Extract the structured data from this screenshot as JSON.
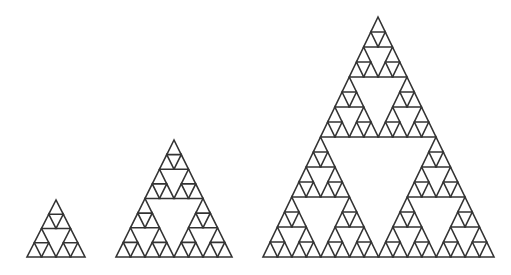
{
  "diagram": {
    "type": "sierpinski-triangles",
    "background": "#ffffff",
    "stroke": "#333333",
    "stroke_width": 1.6,
    "figures": [
      {
        "name": "sierpinski-depth-2",
        "depth": 2,
        "apex": [
          56,
          200
        ],
        "base_left": [
          27,
          257
        ],
        "base_right": [
          85,
          257
        ]
      },
      {
        "name": "sierpinski-depth-3",
        "depth": 3,
        "apex": [
          174,
          140
        ],
        "base_left": [
          116,
          257
        ],
        "base_right": [
          232,
          257
        ]
      },
      {
        "name": "sierpinski-depth-4",
        "depth": 4,
        "apex": [
          378,
          17
        ],
        "base_left": [
          263,
          257
        ],
        "base_right": [
          494,
          257
        ]
      }
    ]
  }
}
